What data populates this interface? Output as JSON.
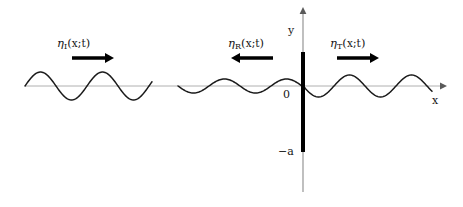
{
  "figure": {
    "background": "#ffffff",
    "axis_color": "#b0b0b0",
    "wave_color": "#1a1a1a",
    "barrier_color": "#000000",
    "text_color": "#151515"
  },
  "axes": {
    "x_label": "x",
    "y_label": "y",
    "origin_label": "0",
    "depth_label": "−a",
    "x_axis": {
      "x_start": 25,
      "x_end": 440,
      "y": 86,
      "arrow": "right"
    },
    "y_axis": {
      "x": 303,
      "y_top": 14,
      "y_bottom": 192,
      "arrow": "up"
    }
  },
  "barrier": {
    "name": "vertical-barrier",
    "x": 303,
    "y_top": 52,
    "y_bottom": 152,
    "thickness": 4,
    "color": "#000000",
    "top_value": "0",
    "bottom_value": "−a"
  },
  "waves": [
    {
      "id": "incident",
      "eta": "η",
      "subscript": "I",
      "label": "η₁(x;t)",
      "label_text_before": "(",
      "label_args": "x;t",
      "label_text_after": ")",
      "direction": "right",
      "arrow_glyph": "→",
      "amplitude": 14,
      "wavelength": 62,
      "x_start": 25,
      "x_end": 152,
      "baseline_y": 86,
      "phase_deg": 0,
      "label_x": 57,
      "label_y": 36,
      "arrow_x": 72,
      "arrow_y": 58,
      "arrow_length": 40
    },
    {
      "id": "reflected",
      "eta": "η",
      "subscript": "R",
      "label": "ηᵣ(x;t)",
      "label_text_before": "(",
      "label_args": "x;t",
      "label_text_after": ")",
      "direction": "left",
      "arrow_glyph": "←",
      "amplitude": 7,
      "wavelength": 62,
      "x_start": 178,
      "x_end": 305,
      "baseline_y": 86,
      "phase_deg": 180,
      "label_x": 228,
      "label_y": 36,
      "arrow_x": 233,
      "arrow_y": 58,
      "arrow_length": 40
    },
    {
      "id": "transmitted",
      "eta": "η",
      "subscript": "T",
      "label": "ηₜ(x;t)",
      "label_text_before": "(",
      "label_args": "x;t",
      "label_text_after": ")",
      "direction": "right",
      "arrow_glyph": "→",
      "amplitude": 11,
      "wavelength": 62,
      "x_start": 303,
      "x_end": 432,
      "baseline_y": 86,
      "phase_deg": 180,
      "label_x": 330,
      "label_y": 36,
      "arrow_x": 337,
      "arrow_y": 58,
      "arrow_length": 40
    }
  ],
  "labels": {
    "y_axis_label": {
      "text": "y",
      "x": 288,
      "y": 24
    },
    "x_axis_label": {
      "text": "x",
      "x": 432,
      "y": 94
    },
    "origin": {
      "text": "0",
      "x": 283,
      "y": 88
    },
    "depth": {
      "text": "−a",
      "x": 278,
      "y": 145
    }
  }
}
